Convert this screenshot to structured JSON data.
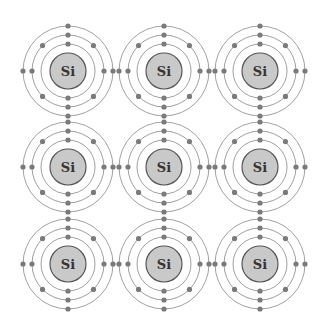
{
  "diagram": {
    "element_symbol": "Si",
    "grid": {
      "rows": 3,
      "cols": 3
    },
    "atom_centers_x": [
      68,
      164,
      260
    ],
    "atom_centers_y": [
      71,
      167,
      264
    ],
    "nucleus_radius": 18,
    "rings": [
      {
        "radius": 27,
        "electron_angles_deg": [
          90,
          270
        ]
      },
      {
        "radius": 36,
        "electron_angles_deg": [
          0,
          45,
          90,
          135,
          180,
          225,
          270,
          315
        ]
      },
      {
        "radius": 45,
        "electron_angles_deg": [
          0,
          90,
          180,
          270
        ]
      }
    ],
    "electron_radius": 2.6,
    "colors": {
      "ring": "#a0a0a0",
      "nucleus_fill": "#c9c9c9",
      "nucleus_stroke": "#555555",
      "electron": "#7a7a7a",
      "label": "#333333",
      "background": "#ffffff"
    },
    "atoms": [
      {
        "label": "Si",
        "row": 0,
        "col": 0
      },
      {
        "label": "Si",
        "row": 0,
        "col": 1
      },
      {
        "label": "Si",
        "row": 0,
        "col": 2
      },
      {
        "label": "Si",
        "row": 1,
        "col": 0
      },
      {
        "label": "Si",
        "row": 1,
        "col": 1
      },
      {
        "label": "Si",
        "row": 1,
        "col": 2
      },
      {
        "label": "Si",
        "row": 2,
        "col": 0
      },
      {
        "label": "Si",
        "row": 2,
        "col": 1
      },
      {
        "label": "Si",
        "row": 2,
        "col": 2
      }
    ]
  }
}
